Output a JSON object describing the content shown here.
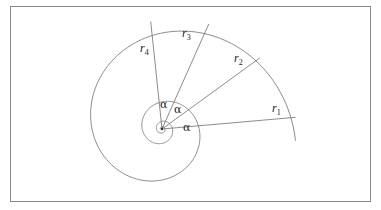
{
  "diagram": {
    "center": {
      "x": 162,
      "y": 129
    },
    "spiral": {
      "r_outer": 134,
      "theta_start_deg": -5,
      "growth_per_30deg": 0.9,
      "turns": 4
    },
    "radii": [
      {
        "name": "r",
        "sub": "1",
        "angle_deg": 5,
        "length": 134,
        "label_x": 272,
        "label_y": 112
      },
      {
        "name": "r",
        "sub": "2",
        "angle_deg": 36,
        "length": 121,
        "label_x": 234,
        "label_y": 62
      },
      {
        "name": "r",
        "sub": "3",
        "angle_deg": 66,
        "length": 115,
        "label_x": 182,
        "label_y": 37
      },
      {
        "name": "r",
        "sub": "4",
        "angle_deg": 96,
        "length": 108,
        "label_x": 140,
        "label_y": 52
      }
    ],
    "angles": [
      {
        "label": "α",
        "x": 183,
        "y": 131
      },
      {
        "label": "α",
        "x": 174,
        "y": 113
      },
      {
        "label": "α",
        "x": 160,
        "y": 108
      }
    ],
    "colors": {
      "line": "#6e6e6e",
      "frame": "#8a8a8a",
      "text": "#222222"
    }
  }
}
